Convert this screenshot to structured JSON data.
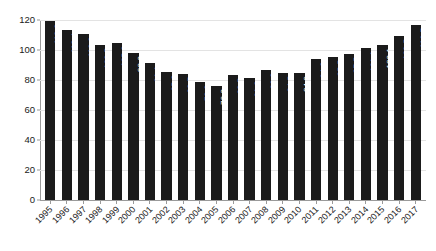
{
  "chart_data": {
    "type": "bar",
    "title": "",
    "subtitle": "",
    "xlabel": "",
    "ylabel": "",
    "ylim": [
      0,
      120
    ],
    "yticks": [
      0,
      20,
      40,
      60,
      80,
      100,
      120
    ],
    "grid": true,
    "legend": "none",
    "bar_color": "#1b1b1b",
    "value_label_color": "#ffffff",
    "categories": [
      "1995",
      "1996",
      "1997",
      "1998",
      "1999",
      "2000",
      "2001",
      "2002",
      "2003",
      "2004",
      "2005",
      "2006",
      "2007",
      "2008",
      "2009",
      "2010",
      "2011",
      "2012",
      "2013",
      "2014",
      "2015",
      "2016",
      "2017"
    ],
    "values": [
      119.3,
      113.4,
      110.8,
      103.5,
      105.0,
      98.3,
      91.1,
      85.2,
      83.7,
      78.8,
      76.3,
      83.5,
      81.2,
      86.8,
      84.5,
      84.9,
      94.3,
      95.5,
      97.5,
      101.1,
      103.1,
      109.5,
      116.7
    ],
    "value_labels": [
      "119.3",
      "113.4",
      "110.8",
      "103.5",
      "105.0",
      "98.3",
      "91.1",
      "85.2",
      "83.7",
      "78.8",
      "76.3",
      "83.5",
      "81.2",
      "86.8",
      "84.5",
      "84.9",
      "94.3",
      "95.5",
      "97.5",
      "101.1",
      "103.1",
      "109.5",
      "116.7"
    ],
    "ytick_labels": [
      "0",
      "20",
      "40",
      "60",
      "80",
      "100",
      "120"
    ]
  }
}
